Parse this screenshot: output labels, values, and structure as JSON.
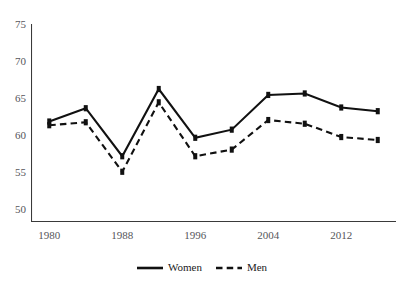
{
  "chart_data": {
    "type": "line",
    "title": "",
    "xlabel": "",
    "ylabel": "",
    "x": [
      1980,
      1984,
      1988,
      1992,
      1996,
      2000,
      2004,
      2008,
      2012,
      2016
    ],
    "xtick_labels": [
      "1980",
      "1988",
      "1996",
      "2004",
      "2012"
    ],
    "xtick_values": [
      1980,
      1988,
      1996,
      2004,
      2012
    ],
    "ytick_labels": [
      "50",
      "55",
      "60",
      "65",
      "70",
      "75"
    ],
    "ytick_values": [
      50,
      55,
      60,
      65,
      70,
      75
    ],
    "xlim": [
      1978,
      2018
    ],
    "ylim": [
      48.2,
      75.0
    ],
    "grid": false,
    "legend_position": "bottom-center",
    "series": [
      {
        "name": "Women",
        "style": "solid",
        "color": "#111111",
        "marker": "square",
        "values": [
          61.8,
          63.6,
          57.1,
          66.2,
          59.6,
          60.7,
          65.4,
          65.6,
          63.7,
          63.2
        ]
      },
      {
        "name": "Men",
        "style": "dashed",
        "color": "#111111",
        "marker": "square",
        "values": [
          61.3,
          61.7,
          55.0,
          64.4,
          57.1,
          58.0,
          62.0,
          61.5,
          59.7,
          59.3
        ]
      }
    ]
  },
  "legend": {
    "items": [
      {
        "label": "Women",
        "style": "solid"
      },
      {
        "label": "Men",
        "style": "dashed"
      }
    ]
  },
  "axis": {
    "line_color": "#3a3a3a"
  }
}
